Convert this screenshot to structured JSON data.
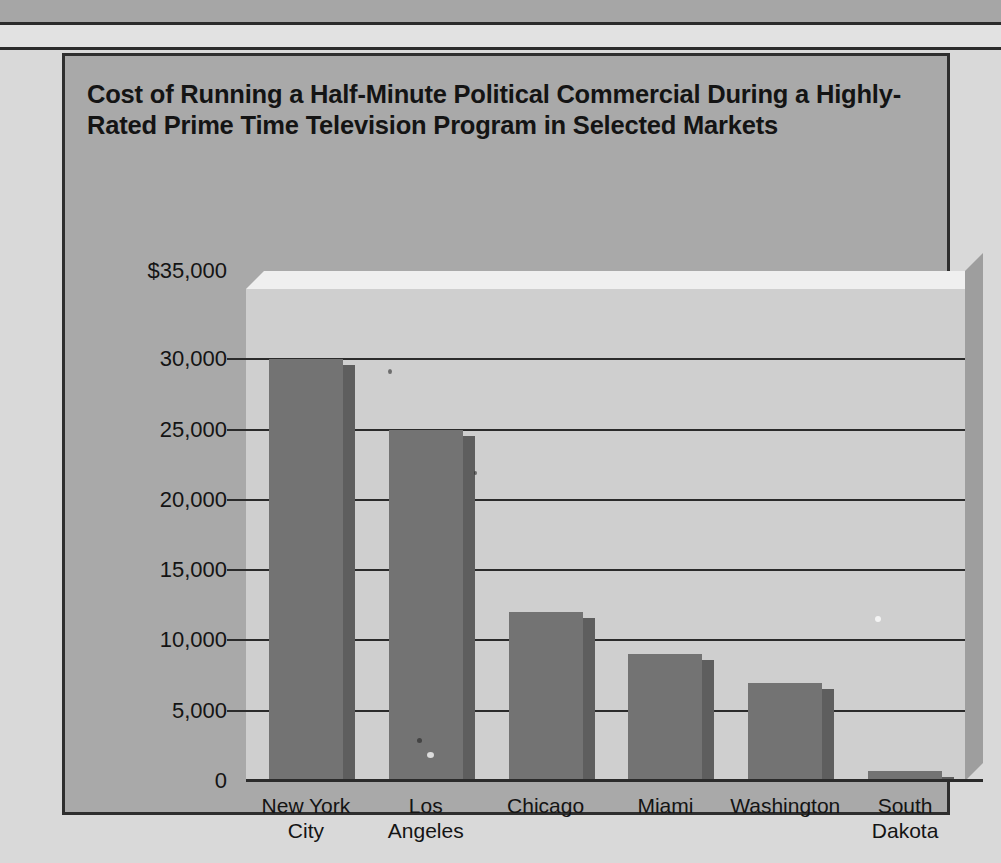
{
  "chart_card": {
    "title": "Cost of Running a Half-Minute Political Commercial During a Highly-Rated Prime Time Television Program in Selected Markets"
  },
  "colors": {
    "page_background": "#d9d9d9",
    "card_background": "#a9a9a9",
    "plot_background": "#cfcfcf",
    "bar_fill": "#737373",
    "bar_side_shadow": "#5e5e5e",
    "gridline": "#2b2b2b",
    "text": "#141414"
  },
  "chart_data": {
    "type": "bar",
    "title": "Cost of Running a Half-Minute Political Commercial During a Highly-Rated Prime Time Television Program in Selected Markets",
    "xlabel": "",
    "ylabel": "",
    "categories": [
      "New York City",
      "Los Angeles",
      "Chicago",
      "Miami",
      "Washington",
      "South Dakota"
    ],
    "category_lines": [
      [
        "New York",
        "City"
      ],
      [
        "Los",
        "Angeles"
      ],
      [
        "Chicago",
        ""
      ],
      [
        "Miami",
        ""
      ],
      [
        "Washington",
        ""
      ],
      [
        "South",
        "Dakota"
      ]
    ],
    "values": [
      30000,
      25000,
      12000,
      9000,
      7000,
      700
    ],
    "ylim": [
      0,
      35000
    ],
    "yticks": [
      0,
      5000,
      10000,
      15000,
      20000,
      25000,
      30000,
      35000
    ],
    "ytick_labels": [
      "0",
      "5,000",
      "10,000",
      "15,000",
      "20,000",
      "25,000",
      "30,000",
      "$35,000"
    ],
    "grid": true,
    "grid_axis": "y",
    "legend": false,
    "style_3d": true,
    "currency_prefix": "$"
  }
}
